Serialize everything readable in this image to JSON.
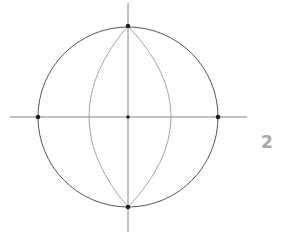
{
  "figure": {
    "label": "2",
    "colors": {
      "circle": "#555555",
      "axes": "#777777",
      "inner_arcs": "#9a9a9a",
      "points": "#222222",
      "label": "#a8a8a8"
    },
    "circle": {
      "cx": 128,
      "cy": 117,
      "r": 90
    },
    "horizontal_axis": {
      "x1": 10,
      "y1": 117,
      "x2": 247,
      "y2": 117
    },
    "vertical_axis": {
      "x1": 128,
      "y1": 3,
      "x2": 128,
      "y2": 232
    },
    "inner_lens": {
      "top": [
        128,
        26
      ],
      "bottom": [
        128,
        207
      ],
      "left_x": 89,
      "right_x": 171
    },
    "points": [
      {
        "name": "top",
        "x": 128,
        "y": 26
      },
      {
        "name": "left",
        "x": 38,
        "y": 117
      },
      {
        "name": "center",
        "x": 128,
        "y": 117
      },
      {
        "name": "right",
        "x": 218,
        "y": 117
      },
      {
        "name": "bottom",
        "x": 128,
        "y": 207
      }
    ]
  }
}
